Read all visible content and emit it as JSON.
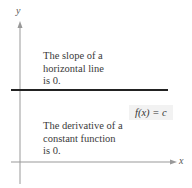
{
  "figure": {
    "axes": {
      "x_label": "x",
      "y_label": "y"
    },
    "line": {
      "type": "horizontal",
      "color": "#222222"
    },
    "function_label": "f(x) = c",
    "annotations": [
      {
        "lines": [
          "The slope of a",
          "horizontal line",
          "is 0."
        ]
      },
      {
        "lines": [
          "The derivative of a",
          "constant function",
          "is 0."
        ]
      }
    ]
  }
}
